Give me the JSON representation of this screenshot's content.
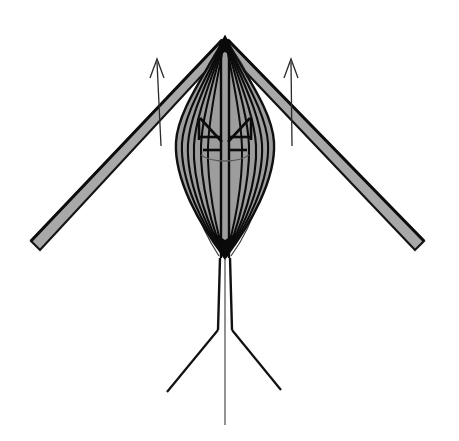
{
  "canvas": {
    "width": 459,
    "height": 441,
    "background": "#ffffff"
  },
  "figure": {
    "title": "",
    "description": "Symmetric technical line drawing of a kite-like winged structure with a central lens-shaped body, two diagonal spar wings, two upward annotation arrows and a tripod base",
    "colors": {
      "background": "#ffffff",
      "ink": "#111111",
      "outline": "#1a1a1a",
      "body_fill": "#9d9d9d",
      "wing_fill": "#a8a8a8",
      "hairline": "#4a4a4a"
    },
    "apex": {
      "x": 225,
      "y": 37
    },
    "body": {
      "name": "central-lens-body",
      "top_y": 37,
      "bottom_y": 258,
      "max_half_width": 50,
      "widest_y": 140,
      "fill": "#9d9d9d",
      "contour_count": 6
    },
    "left_wing": {
      "name": "left-spar-wing",
      "root": {
        "x": 222,
        "y": 40
      },
      "tip_outer": {
        "x": 31,
        "y": 241
      },
      "tip_inner": {
        "x": 38,
        "y": 249
      },
      "thickness": 11,
      "fill": "#a8a8a8"
    },
    "right_wing": {
      "name": "right-spar-wing",
      "root": {
        "x": 228,
        "y": 40
      },
      "tip_outer": {
        "x": 424,
        "y": 241
      },
      "tip_inner": {
        "x": 417,
        "y": 249
      },
      "thickness": 11,
      "fill": "#a8a8a8"
    },
    "left_arrow": {
      "name": "left-annotation-arrow",
      "tail": {
        "x": 161,
        "y": 144
      },
      "head": {
        "x": 157,
        "y": 60
      },
      "head_width": 11,
      "head_length": 17
    },
    "right_arrow": {
      "name": "right-annotation-arrow",
      "tail": {
        "x": 291,
        "y": 144
      },
      "head": {
        "x": 291,
        "y": 60
      },
      "head_width": 11,
      "head_length": 17
    },
    "envelope_curve": {
      "name": "outer-envelope-curve",
      "top": {
        "x": 224,
        "y": 42
      },
      "bottom": {
        "x": 226,
        "y": 256
      },
      "left_extreme_x": 172,
      "right_extreme_x": 282,
      "stroke_width": 1
    },
    "tripod": {
      "name": "tripod-base",
      "mast_left_x": 219,
      "mast_right_x": 231,
      "mast_top_y": 258,
      "knee_y": 330,
      "left_foot": {
        "x": 167,
        "y": 392
      },
      "right_foot": {
        "x": 281,
        "y": 390
      },
      "center_line": {
        "x": 225,
        "top_y": 258,
        "bottom_y": 425
      }
    },
    "inner_detail": {
      "name": "body-inner-cross",
      "cross_center": {
        "x": 225,
        "y": 142
      },
      "cross_arm_half": 26,
      "upper_vee_y": 117,
      "lower_arc_y": 158
    }
  }
}
